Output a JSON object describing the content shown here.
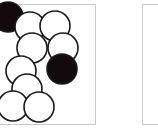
{
  "panels": [
    {
      "name": "left-panel",
      "x": -2,
      "y": 4,
      "w": 98,
      "h": 121
    },
    {
      "name": "right-panel",
      "x": 142,
      "y": 4,
      "w": 30,
      "h": 121
    }
  ],
  "stones": [
    {
      "cx": 8,
      "cy": 17,
      "color": "black"
    },
    {
      "cx": 30,
      "cy": 27,
      "color": "white"
    },
    {
      "cx": 55,
      "cy": 26,
      "color": "white"
    },
    {
      "cx": 32,
      "cy": 48,
      "color": "white"
    },
    {
      "cx": 63,
      "cy": 48,
      "color": "white"
    },
    {
      "cx": 62,
      "cy": 69,
      "color": "black"
    },
    {
      "cx": 21,
      "cy": 71,
      "color": "white"
    },
    {
      "cx": 27,
      "cy": 89,
      "color": "white"
    },
    {
      "cx": 13,
      "cy": 106,
      "color": "white"
    },
    {
      "cx": 39,
      "cy": 107,
      "color": "white"
    }
  ],
  "stone_radius": 15,
  "colors": {
    "black": "#120a0c",
    "white": "#ffffff",
    "stroke": "#1a1a1a",
    "frame": "#c8c8c8"
  }
}
